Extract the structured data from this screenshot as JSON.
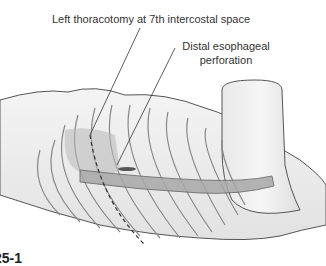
{
  "figure": {
    "labels": [
      {
        "id": "thoracotomy",
        "text": "Left thoracotomy at 7th intercostal space"
      },
      {
        "id": "perforation",
        "text": "Distal esophageal perforation"
      }
    ],
    "figure_number_partial": "25-1"
  }
}
